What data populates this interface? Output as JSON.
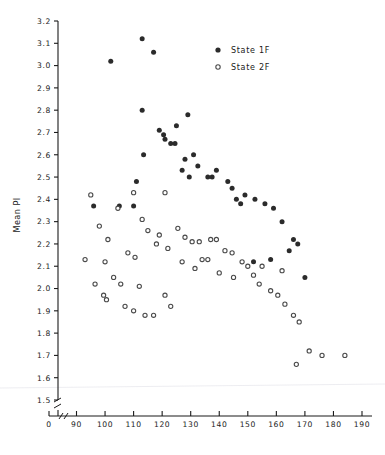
{
  "chart_data": {
    "type": "scatter",
    "title": "",
    "xlabel": "",
    "ylabel": "Mean PI",
    "xlim": [
      85,
      190
    ],
    "ylim": [
      1.5,
      3.2
    ],
    "x_ticks": [
      0,
      90,
      100,
      110,
      120,
      130,
      140,
      150,
      160,
      170,
      180,
      190
    ],
    "y_ticks": [
      1.5,
      1.6,
      1.7,
      1.8,
      1.9,
      2.0,
      2.1,
      2.2,
      2.3,
      2.4,
      2.5,
      2.6,
      2.7,
      2.8,
      2.9,
      3.0,
      3.1,
      3.2
    ],
    "x_axis_break": true,
    "y_axis_break": true,
    "grid": false,
    "legend_position": "top-right",
    "marker_colors": {
      "state_1f": "#2b2b2b",
      "state_2f": "#ffffff",
      "state_2f_edge": "#4a4a4a"
    },
    "series": [
      {
        "name": "State 1F",
        "marker": "filled-circle",
        "points": [
          [
            102.0,
            3.02
          ],
          [
            113.0,
            3.12
          ],
          [
            117.0,
            3.06
          ],
          [
            113.0,
            2.8
          ],
          [
            125.0,
            2.73
          ],
          [
            129.0,
            2.78
          ],
          [
            119.0,
            2.71
          ],
          [
            120.5,
            2.69
          ],
          [
            121.0,
            2.67
          ],
          [
            123.0,
            2.65
          ],
          [
            124.5,
            2.65
          ],
          [
            113.5,
            2.6
          ],
          [
            128.0,
            2.58
          ],
          [
            131.0,
            2.6
          ],
          [
            132.5,
            2.55
          ],
          [
            127.0,
            2.53
          ],
          [
            129.5,
            2.5
          ],
          [
            136.0,
            2.5
          ],
          [
            137.5,
            2.5
          ],
          [
            139.0,
            2.53
          ],
          [
            143.0,
            2.48
          ],
          [
            144.5,
            2.45
          ],
          [
            111.0,
            2.48
          ],
          [
            146.0,
            2.4
          ],
          [
            147.5,
            2.38
          ],
          [
            149.0,
            2.42
          ],
          [
            152.5,
            2.4
          ],
          [
            96.0,
            2.37
          ],
          [
            110.0,
            2.37
          ],
          [
            105.0,
            2.37
          ],
          [
            156.0,
            2.38
          ],
          [
            159.0,
            2.36
          ],
          [
            162.0,
            2.3
          ],
          [
            166.0,
            2.22
          ],
          [
            167.5,
            2.2
          ],
          [
            164.5,
            2.17
          ],
          [
            152.0,
            2.12
          ],
          [
            158.0,
            2.13
          ],
          [
            170.0,
            2.05
          ]
        ]
      },
      {
        "name": "State 2F",
        "marker": "open-circle",
        "points": [
          [
            95.0,
            2.42
          ],
          [
            110.0,
            2.43
          ],
          [
            121.0,
            2.43
          ],
          [
            98.0,
            2.28
          ],
          [
            104.5,
            2.36
          ],
          [
            113.0,
            2.31
          ],
          [
            101.0,
            2.22
          ],
          [
            115.0,
            2.26
          ],
          [
            119.0,
            2.24
          ],
          [
            125.5,
            2.27
          ],
          [
            93.0,
            2.13
          ],
          [
            100.0,
            2.12
          ],
          [
            108.0,
            2.16
          ],
          [
            110.5,
            2.14
          ],
          [
            118.0,
            2.2
          ],
          [
            122.0,
            2.18
          ],
          [
            128.0,
            2.23
          ],
          [
            130.5,
            2.21
          ],
          [
            133.0,
            2.21
          ],
          [
            137.0,
            2.22
          ],
          [
            139.0,
            2.22
          ],
          [
            142.0,
            2.17
          ],
          [
            144.5,
            2.16
          ],
          [
            148.0,
            2.12
          ],
          [
            150.0,
            2.1
          ],
          [
            134.0,
            2.13
          ],
          [
            136.0,
            2.13
          ],
          [
            127.0,
            2.12
          ],
          [
            131.5,
            2.09
          ],
          [
            140.0,
            2.07
          ],
          [
            145.0,
            2.05
          ],
          [
            152.0,
            2.06
          ],
          [
            154.0,
            2.02
          ],
          [
            158.0,
            1.99
          ],
          [
            160.5,
            1.97
          ],
          [
            163.0,
            1.93
          ],
          [
            166.0,
            1.88
          ],
          [
            168.0,
            1.85
          ],
          [
            171.5,
            1.72
          ],
          [
            176.0,
            1.7
          ],
          [
            184.0,
            1.7
          ],
          [
            167.0,
            1.66
          ],
          [
            103.0,
            2.05
          ],
          [
            105.5,
            2.02
          ],
          [
            99.5,
            1.97
          ],
          [
            100.5,
            1.95
          ],
          [
            107.0,
            1.92
          ],
          [
            110.0,
            1.9
          ],
          [
            114.0,
            1.88
          ],
          [
            117.0,
            1.88
          ],
          [
            121.0,
            1.97
          ],
          [
            123.0,
            1.92
          ],
          [
            112.0,
            2.01
          ],
          [
            96.5,
            2.02
          ],
          [
            155.0,
            2.1
          ],
          [
            162.0,
            2.08
          ]
        ]
      }
    ]
  },
  "legend": {
    "entries": [
      {
        "label": "State 1F",
        "marker": "filled-circle"
      },
      {
        "label": "State 2F",
        "marker": "open-circle"
      }
    ]
  },
  "axes": {
    "y_title": "Mean PI",
    "y_tick_labels": [
      "3.2",
      "3.1",
      "3.0",
      "2.9",
      "2.8",
      "2.7",
      "2.6",
      "2.5",
      "2.4",
      "2.3",
      "2.2",
      "2.1",
      "2.0",
      "1.9",
      "1.8",
      "1.7",
      "1.6",
      "1.5"
    ],
    "x_tick_labels": [
      "0",
      "90",
      "100",
      "110",
      "120",
      "130",
      "140",
      "150",
      "160",
      "170",
      "180",
      "190"
    ]
  }
}
